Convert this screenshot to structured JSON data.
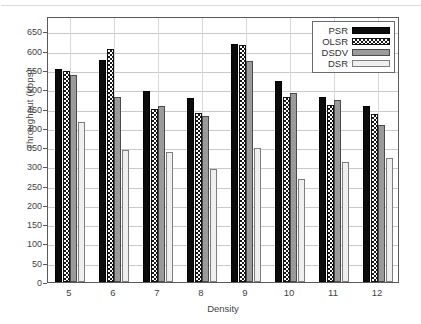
{
  "chart_data": {
    "type": "bar",
    "title": "",
    "xlabel": "Density",
    "ylabel": "Throughput (kbps)",
    "categories": [
      "5",
      "6",
      "7",
      "8",
      "9",
      "10",
      "11",
      "12"
    ],
    "series": [
      {
        "name": "PSR",
        "values": [
          553,
          577,
          496,
          478,
          617,
          522,
          479,
          457
        ]
      },
      {
        "name": "OLSR",
        "values": [
          548,
          605,
          450,
          438,
          616,
          481,
          459,
          435
        ]
      },
      {
        "name": "DSDV",
        "values": [
          537,
          479,
          457,
          431,
          573,
          491,
          473,
          406
        ]
      },
      {
        "name": "DSR",
        "values": [
          415,
          343,
          336,
          294,
          348,
          268,
          312,
          321
        ]
      }
    ],
    "ylim": [
      0,
      690
    ],
    "yticks": [
      0,
      50,
      100,
      150,
      200,
      250,
      300,
      350,
      400,
      450,
      500,
      550,
      600,
      650
    ],
    "ytick_labels": [
      "0",
      "50",
      "100",
      "150",
      "200",
      "250",
      "300",
      "350",
      "400",
      "450",
      "500",
      "550",
      "600",
      "650"
    ],
    "grid": true,
    "legend_position": "top-right",
    "legend_entries": [
      "PSR",
      "OLSR",
      "DSDV",
      "DSR"
    ],
    "series_styles": [
      "solid-black",
      "checkered",
      "gray-dotted",
      "light-dotted"
    ],
    "colors": {
      "psr": "#0b0b0b",
      "olsr": "#1a1a1a",
      "dsdv": "#9b9b9b",
      "dsr": "#efefef",
      "axis": "#5a5a5a",
      "grid": "#c9c9c9",
      "text": "#3f3f3f",
      "background": "#ffffff"
    }
  }
}
